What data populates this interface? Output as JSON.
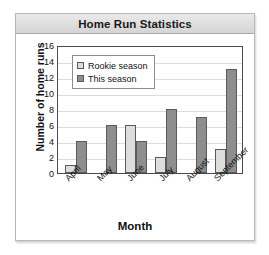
{
  "card": {
    "title": "Home Run Statistics"
  },
  "chart_data": {
    "type": "bar",
    "title": "Home Run Statistics",
    "xlabel": "Month",
    "ylabel": "Number of home runs",
    "categories": [
      "April",
      "May",
      "June",
      "July",
      "August",
      "September"
    ],
    "series": [
      {
        "name": "Rookie season",
        "color": "#dddddd",
        "values": [
          1,
          0,
          6,
          2,
          0,
          3
        ]
      },
      {
        "name": "This season",
        "color": "#8e8e8e",
        "values": [
          4,
          6,
          4,
          8,
          7,
          13
        ]
      }
    ],
    "ylim": [
      0,
      16
    ],
    "yticks": [
      0,
      2,
      4,
      6,
      8,
      10,
      12,
      14,
      16
    ],
    "grid": true,
    "legend_position": "upper left",
    "legend_entries": [
      "Rookie season",
      "This season"
    ]
  },
  "yticks": {
    "t0": "0",
    "t1": "2",
    "t2": "4",
    "t3": "6",
    "t4": "8",
    "t5": "10",
    "t6": "12",
    "t7": "14",
    "t8": "16"
  },
  "legend": {
    "rookie_label": "Rookie season",
    "current_label": "This season"
  },
  "xticks": {
    "m0": "April",
    "m1": "May",
    "m2": "June",
    "m3": "July",
    "m4": "August",
    "m5": "September"
  },
  "axis": {
    "x_title": "Month",
    "y_title": "Number of home runs"
  }
}
